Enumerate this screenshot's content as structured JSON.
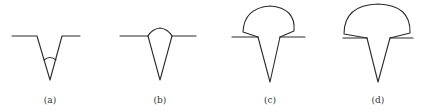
{
  "figure": {
    "panels": [
      {
        "id": "a",
        "label": "(a)",
        "description": "V-groove with small root weld bead inside"
      },
      {
        "id": "b",
        "label": "(b)",
        "description": "V-groove filled with slight reinforcement cap"
      },
      {
        "id": "c",
        "label": "(c)",
        "description": "V-groove with large mushroom-shaped cap"
      },
      {
        "id": "d",
        "label": "(d)",
        "description": "V-groove with larger mushroom-shaped cap"
      }
    ],
    "line_color": "#2a2a2a"
  }
}
